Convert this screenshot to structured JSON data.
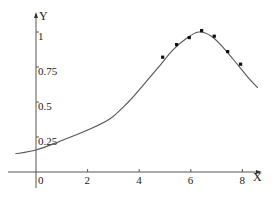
{
  "chart_data": {
    "type": "line",
    "title": "",
    "xlabel": "X",
    "ylabel": "Y",
    "xlim": [
      -0.8,
      8.7
    ],
    "ylim": [
      0,
      1.08
    ],
    "grid": false,
    "legend": null,
    "x_ticks": [
      0,
      2,
      4,
      6,
      8
    ],
    "x_tick_labels": [
      "0",
      "2",
      "4",
      "6",
      "8"
    ],
    "y_ticks": [
      0.25,
      0.5,
      0.75,
      1
    ],
    "y_tick_labels": [
      "0.25",
      "0.5",
      "0.75",
      "1"
    ],
    "series": [
      {
        "name": "fitted curve",
        "kind": "line",
        "color": "#555555",
        "x": [
          -0.8,
          0,
          0.93,
          2,
          2.87,
          3.58,
          4.2,
          4.8,
          5.3,
          5.8,
          6.3,
          6.8,
          7.3,
          7.8,
          8.2,
          8.6
        ],
        "y": [
          0.13,
          0.157,
          0.22,
          0.3,
          0.38,
          0.5,
          0.63,
          0.76,
          0.87,
          0.95,
          1.0,
          0.97,
          0.88,
          0.77,
          0.68,
          0.6
        ]
      },
      {
        "name": "data points",
        "kind": "scatter",
        "color": "#111111",
        "x": [
          4.91,
          5.45,
          5.94,
          6.42,
          6.91,
          7.43,
          7.93
        ],
        "y": [
          0.82,
          0.91,
          0.96,
          1.01,
          0.97,
          0.86,
          0.77
        ]
      }
    ]
  },
  "axes": {
    "x_label": "X",
    "y_label": "Y",
    "x_tick_labels": [
      "0",
      "2",
      "4",
      "6",
      "8"
    ],
    "y_tick_labels": [
      "0.25",
      "0.5",
      "0.75",
      "1"
    ]
  }
}
